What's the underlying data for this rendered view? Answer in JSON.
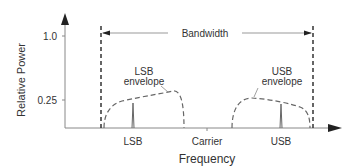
{
  "diagram": {
    "y_axis": {
      "label": "Relative Power",
      "ticks": [
        {
          "label": "1.0",
          "value": 1.0
        },
        {
          "label": "0.25",
          "value": 0.25
        }
      ]
    },
    "x_axis": {
      "label": "Frequency",
      "ticks": [
        {
          "label": "LSB"
        },
        {
          "label": "Carrier"
        },
        {
          "label": "USB"
        }
      ]
    },
    "annotations": {
      "bandwidth": "Bandwidth",
      "lsb_envelope_line1": "LSB",
      "lsb_envelope_line2": "envelope",
      "usb_envelope_line1": "USB",
      "usb_envelope_line2": "envelope"
    },
    "colors": {
      "axis": "#555555",
      "dashed": "#333333",
      "envelope": "#666666",
      "text": "#333333"
    }
  }
}
